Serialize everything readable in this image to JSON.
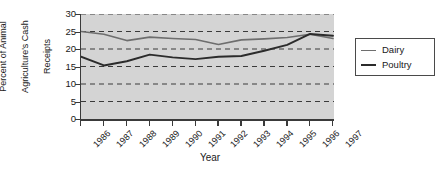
{
  "chart_data": {
    "type": "line",
    "title": "",
    "xlabel": "Year",
    "ylabel": "Percent of Animal Agriculture's Cash Receipts",
    "ylabel_lines": [
      "Percent of Animal",
      "Agriculture's Cash",
      "Receipts"
    ],
    "categories": [
      "1986",
      "1987",
      "1988",
      "1989",
      "1990",
      "1991",
      "1992",
      "1993",
      "1994",
      "1995",
      "1996",
      "1997"
    ],
    "x": [
      1986,
      1987,
      1988,
      1989,
      1990,
      1991,
      1992,
      1993,
      1994,
      1995,
      1996,
      1997
    ],
    "ylim": [
      0,
      30
    ],
    "xlim": [
      1986,
      1997
    ],
    "yticks": [
      0,
      5,
      10,
      15,
      20,
      25,
      30
    ],
    "ytick_labels": [
      "0",
      "5",
      "10",
      "15",
      "20",
      "25",
      "30"
    ],
    "grid": true,
    "grid_style": "dashed-horizontal",
    "legend_position": "right",
    "plot_background": "#d4d4d4",
    "series": [
      {
        "name": "Dairy",
        "color": "#6e6e6e",
        "values": [
          25.0,
          24.2,
          22.4,
          23.4,
          23.0,
          22.7,
          21.3,
          22.6,
          22.9,
          23.3,
          24.2,
          23.0
        ]
      },
      {
        "name": "Poultry",
        "color": "#2b2b2b",
        "values": [
          17.8,
          15.3,
          16.5,
          18.4,
          17.6,
          17.1,
          17.8,
          18.0,
          19.5,
          21.2,
          24.3,
          23.8
        ]
      }
    ]
  },
  "legend": {
    "entries": [
      {
        "label": "Dairy"
      },
      {
        "label": "Poultry"
      }
    ]
  },
  "colors": {
    "dairy": "#6e6e6e",
    "poultry": "#2b2b2b",
    "plot_bg": "#d4d4d4",
    "axis": "#3a3a3a",
    "page_bg": "#ffffff"
  }
}
